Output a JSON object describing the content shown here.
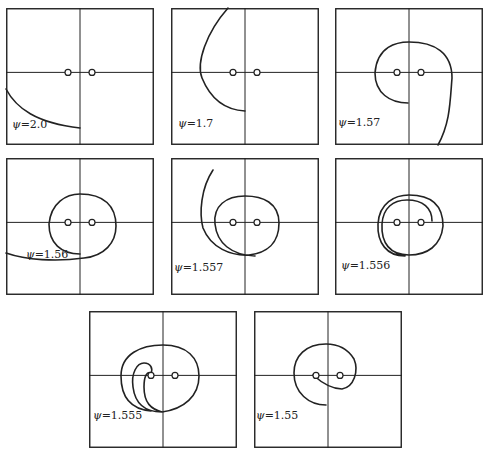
{
  "figure": {
    "style": {
      "line_color": "#222222",
      "background": "#ffffff"
    },
    "symbol": "ψ",
    "panels": [
      {
        "id": "p1",
        "value": "2.0",
        "left": 6,
        "top": 8,
        "label_pos": [
          6,
          110
        ],
        "curve": "M0,81 C10,100 30,115 74,120"
      },
      {
        "id": "p2",
        "value": "1.7",
        "left": 171,
        "top": 8,
        "label_pos": [
          7,
          109
        ],
        "curve": "M57,0 C35,25 25,55 31,70 C40,92 55,102 74,103"
      },
      {
        "id": "p3",
        "value": "1.57",
        "left": 335,
        "top": 8,
        "label_pos": [
          3,
          108
        ],
        "curve": "M73,95 C55,95 40,85 40,65 C42,38 62,34 74,34 C100,34 117,45 117,70 C115,95 115,115 103,137"
      },
      {
        "id": "p4",
        "value": "1.56",
        "left": 6,
        "top": 158,
        "label_pos": [
          20,
          90
        ],
        "curve": "M74,96 C55,96 43,85 43,66 C45,45 60,36 74,36 C98,36 110,48 110,68 C110,85 98,98 78,100 C50,104 20,102 0,95"
      },
      {
        "id": "p5",
        "value": "1.557",
        "left": 171,
        "top": 158,
        "label_pos": [
          3,
          103
        ],
        "curve": "M42,12 C30,30 28,55 32,70 C40,90 60,98 78,97 C96,95 108,85 108,65 C108,45 92,38 74,38 C55,38 42,48 44,66 C46,85 60,97 84,98"
      },
      {
        "id": "p6",
        "value": "1.556",
        "left": 335,
        "top": 158,
        "label_pos": [
          6,
          101
        ],
        "curve": "M70,98 C52,98 42,85 43,66 C44,45 60,37 74,37 C98,37 108,48 108,68 C106,88 92,97 74,97 C55,97 46,85 47,66 C48,50 58,42 72,42 C88,42 97,50 97,63"
      },
      {
        "id": "p7",
        "value": "1.555",
        "left": 89,
        "top": 311,
        "label_pos": [
          4,
          98
        ],
        "curve": "M73,101 C55,101 46,92 44,76 C42,62 48,52 55,52 C62,52 64,58 62,62 M73,101 C62,98 55,92 55,76 C55,65 58,60 62,62 M62,100 C40,98 32,85 32,65 C32,43 52,34 74,34 C98,34 110,47 110,65 C110,85 95,98 73,101"
      },
      {
        "id": "p8",
        "value": "1.55",
        "left": 254,
        "top": 311,
        "label_pos": [
          2,
          98
        ],
        "curve": "M59,64 C68,72 78,78 88,78 C100,76 105,60 100,48 C92,35 80,33 72,33 C52,33 40,45 40,62 C40,82 55,94 72,94"
      }
    ],
    "axis_frac": {
      "vx": 0.5,
      "hy": 0.47
    },
    "sources_dx": 12
  }
}
